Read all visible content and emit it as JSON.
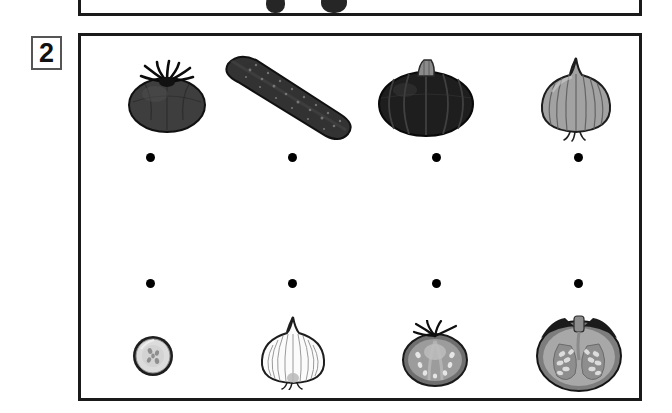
{
  "worksheet": {
    "exercise_number": "2",
    "previous_panel": {
      "visible": "bottom-edge-only",
      "clipped_shapes": [
        "vegetable-silhouette",
        "vegetable-silhouette"
      ]
    },
    "panel": {
      "top_row_label": "whole vegetables",
      "bottom_row_label": "cut vegetables",
      "columns": 4
    },
    "top_row": [
      {
        "id": "tomato-whole",
        "name": "tomato",
        "icon": "tomato-whole-icon",
        "color": "#3b3b3b"
      },
      {
        "id": "cucumber-whole",
        "name": "cucumber",
        "icon": "cucumber-whole-icon",
        "color": "#343434"
      },
      {
        "id": "pumpkin-whole",
        "name": "pumpkin",
        "icon": "pumpkin-whole-icon",
        "color": "#232323"
      },
      {
        "id": "onion-whole",
        "name": "onion",
        "icon": "onion-whole-icon",
        "color": "#9a9a9a"
      }
    ],
    "top_dots": [
      {
        "id": "dot-top-1",
        "label": ""
      },
      {
        "id": "dot-top-2",
        "label": ""
      },
      {
        "id": "dot-top-3",
        "label": ""
      },
      {
        "id": "dot-top-4",
        "label": ""
      }
    ],
    "bottom_dots": [
      {
        "id": "dot-bottom-1",
        "label": ""
      },
      {
        "id": "dot-bottom-2",
        "label": ""
      },
      {
        "id": "dot-bottom-3",
        "label": ""
      },
      {
        "id": "dot-bottom-4",
        "label": ""
      }
    ],
    "bottom_row": [
      {
        "id": "cucumber-slice",
        "name": "cucumber slice",
        "icon": "cucumber-slice-icon",
        "color": "#d8d8d8"
      },
      {
        "id": "onion-half",
        "name": "onion half",
        "icon": "onion-half-icon",
        "color": "#f2f2f2"
      },
      {
        "id": "tomato-half",
        "name": "tomato half",
        "icon": "tomato-half-icon",
        "color": "#9b9b9b"
      },
      {
        "id": "pumpkin-half",
        "name": "pumpkin half",
        "icon": "pumpkin-half-icon",
        "color": "#a6a6a6"
      }
    ],
    "colors": {
      "border": "#1a1a1a",
      "badge_border": "#555555",
      "dot": "#000000",
      "background": "#ffffff"
    }
  }
}
